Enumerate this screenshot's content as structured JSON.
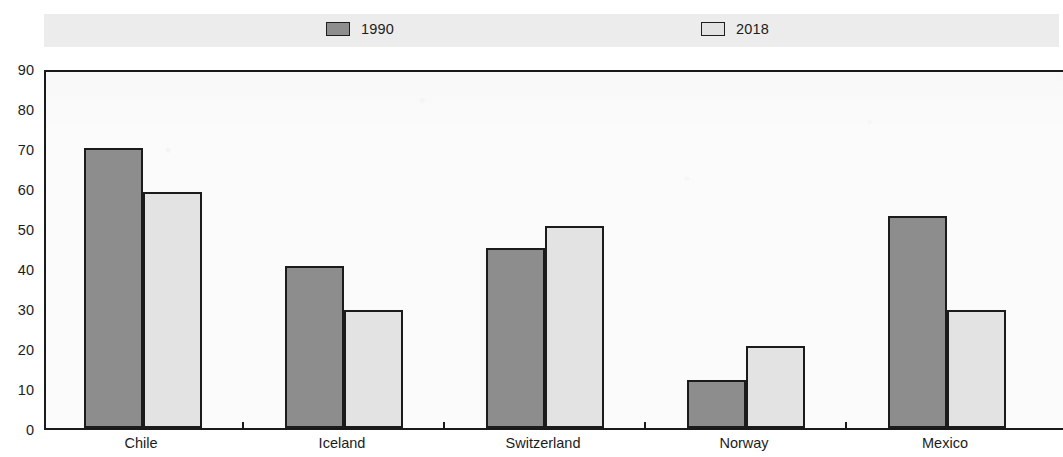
{
  "chart_data": {
    "type": "bar",
    "title": "",
    "subtitle": "",
    "xlabel": "",
    "ylabel": "",
    "ylim": [
      0,
      90
    ],
    "y_ticks": [
      0,
      10,
      20,
      30,
      40,
      50,
      60,
      70,
      80,
      90
    ],
    "grid": false,
    "legend_position": "top",
    "categories": [
      "Chile",
      "Iceland",
      "Switzerland",
      "Norway",
      "Mexico"
    ],
    "series": [
      {
        "name": "1990",
        "color": "#8d8d8d",
        "values": [
          70,
          40.5,
          45,
          12,
          53
        ]
      },
      {
        "name": "2018",
        "color": "#e3e3e3",
        "values": [
          59,
          29.5,
          50.5,
          20.5,
          29.5
        ]
      }
    ]
  },
  "legend": {
    "entries": [
      {
        "label": "1990",
        "swatch": "dark-gray-swatch"
      },
      {
        "label": "2018",
        "swatch": "light-gray-swatch"
      }
    ]
  },
  "axes": {
    "y_tick_labels": [
      "90",
      "80",
      "70",
      "60",
      "50",
      "40",
      "30",
      "20",
      "10",
      "0"
    ],
    "x_tick_labels": [
      "Chile",
      "Iceland",
      "Switzerland",
      "Norway",
      "Mexico"
    ]
  }
}
